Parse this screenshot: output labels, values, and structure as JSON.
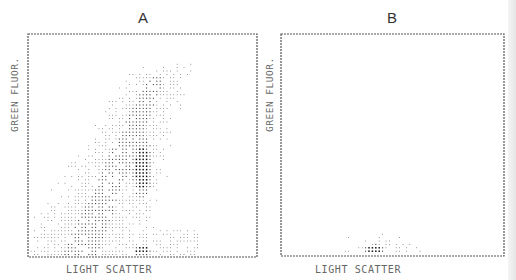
{
  "chart_data": [
    {
      "type": "scatter",
      "subtype": "dot-density flow cytometry plot",
      "title": "A",
      "xlabel": "LIGHT SCATTER",
      "ylabel": "GREEN FLUOR.",
      "xlim": [
        0,
        1
      ],
      "ylim": [
        0,
        1
      ],
      "grid": false,
      "description": "Broad diagonal population rising from lower-left to upper-middle, dense elongated core near x 0.5, y 0.3-0.5, and a dense cluster at baseline near x 0.5",
      "populations": [
        {
          "name": "diffuse diagonal cloud",
          "x_range": [
            0.1,
            0.85
          ],
          "y_range": [
            0.0,
            0.88
          ],
          "density": "low-medium"
        },
        {
          "name": "dense core",
          "center": [
            0.5,
            0.4
          ],
          "density": "high"
        },
        {
          "name": "baseline cluster",
          "center": [
            0.5,
            0.03
          ],
          "density": "high"
        }
      ]
    },
    {
      "type": "scatter",
      "subtype": "dot-density flow cytometry plot",
      "title": "B",
      "xlabel": "LIGHT SCATTER",
      "ylabel": "GREEN FLUOR.",
      "xlim": [
        0,
        1
      ],
      "ylim": [
        0,
        1
      ],
      "grid": false,
      "description": "Low fluorescence population confined near the x-axis, densest near x 0.42",
      "populations": [
        {
          "name": "low fluorescence band",
          "x_range": [
            0.2,
            0.65
          ],
          "y_range": [
            0.0,
            0.1
          ],
          "density": "low-medium"
        },
        {
          "name": "dense core",
          "center": [
            0.42,
            0.03
          ],
          "density": "high"
        }
      ]
    }
  ],
  "colors": {
    "frame": "#555555",
    "dot": "#333333",
    "dense": "#111111"
  }
}
